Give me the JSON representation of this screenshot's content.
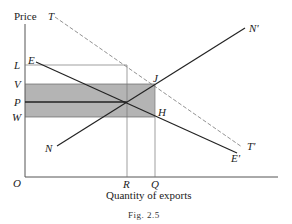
{
  "figure": {
    "y_axis_label": "Price",
    "x_axis_label": "Quantity of exports",
    "caption": "Fig. 2.5",
    "origin_label": "O",
    "y_ticks": [
      {
        "label": "L",
        "y": 65
      },
      {
        "label": "V",
        "y": 84
      },
      {
        "label": "P",
        "y": 102
      },
      {
        "label": "W",
        "y": 117
      }
    ],
    "x_ticks": [
      {
        "label": "R",
        "x": 127
      },
      {
        "label": "Q",
        "x": 155
      }
    ],
    "curves": [
      {
        "name": "EE'",
        "start_label": "E",
        "end_label": "E'",
        "style": "solid"
      },
      {
        "name": "NN'",
        "start_label": "N",
        "end_label": "N'",
        "style": "solid"
      },
      {
        "name": "TT'",
        "start_label": "T",
        "end_label": "T'",
        "style": "dashed"
      }
    ],
    "points": [
      {
        "label": "J"
      },
      {
        "label": "H"
      }
    ],
    "shaded_region": {
      "from": "V",
      "to": "W",
      "color": "#a9a9a9"
    }
  }
}
